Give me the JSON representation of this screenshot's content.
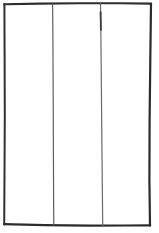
{
  "figure": {
    "kind": "line-sketch",
    "width": 159,
    "height": 233,
    "background_color": "#ffffff",
    "ink_color": "#3a3a3a",
    "ink_color_dark": "#262626",
    "ink_color_light": "#8a8a8a"
  },
  "shapes": {
    "outer_frame": {
      "name": "outer-rectangle",
      "label": "Outer rectangle border",
      "stroke_width": 2.0,
      "color": "#333333",
      "path": "M 4.5 4.0 L 151.0 3.2 L 150.0 225.5 L 4.0 224.6 Z"
    },
    "top_edge": {
      "name": "top-edge",
      "label": "Top edge",
      "stroke_width": 2.1,
      "color": "#2e2e2e",
      "path": "M 4.2 4.2 L 40 3.6 L 80 3.3 L 120 3.2 L 151.2 3.6"
    },
    "right_edge": {
      "name": "right-edge",
      "label": "Right edge",
      "stroke_width": 2.2,
      "color": "#2b2b2b",
      "path": "M 151.0 3.8 L 150.3 60 L 149.6 120 L 149.4 180 L 150.0 225.4"
    },
    "bottom_edge": {
      "name": "bottom-edge",
      "label": "Bottom edge",
      "stroke_width": 2.2,
      "color": "#2b2b2b",
      "path": "M 4.2 224.2 L 45 225.2 L 90 225.6 L 125 225.5 L 150.2 225.4"
    },
    "left_edge": {
      "name": "left-edge",
      "label": "Left edge",
      "stroke_width": 2.0,
      "color": "#303030",
      "path": "M 4.4 4.0 L 4.6 55 L 4.8 115 L 4.5 175 L 4.2 224.4"
    },
    "divider_lines": [
      {
        "name": "divider-line-1",
        "label": "First vertical divider",
        "stroke_width": 1.2,
        "color": "#5f5f5f",
        "path": "M 52.6 4.0 L 52.9 40 L 53.2 95 L 53.4 150 L 53.6 200 L 53.8 225.0"
      },
      {
        "name": "divider-line-2",
        "label": "Second vertical divider",
        "stroke_width": 1.2,
        "color": "#6a6a6a",
        "path": "M 100.5 3.6 L 100.9 35 L 101.4 90 L 101.9 145 L 102.4 195 L 102.7 225.4"
      }
    ],
    "divider_2_accent": {
      "name": "divider-line-2-accent",
      "label": "Darker inked segment on second divider",
      "stroke_width": 1.8,
      "color": "#3d3d3d",
      "path": "M 100.6 12.0 L 100.9 30.0"
    },
    "panels": [
      {
        "name": "panel-left",
        "label": "Left panel"
      },
      {
        "name": "panel-center",
        "label": "Center panel"
      },
      {
        "name": "panel-right",
        "label": "Right panel"
      }
    ]
  }
}
